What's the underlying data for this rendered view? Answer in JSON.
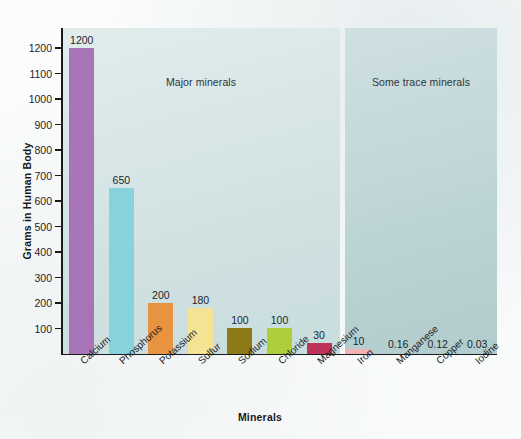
{
  "chart_data": {
    "type": "bar",
    "title": "",
    "xlabel": "Minerals",
    "ylabel": "Grams in Human Body",
    "ylim": [
      0,
      1260
    ],
    "grid": false,
    "legend": "none",
    "y_ticks": [
      100,
      200,
      300,
      400,
      500,
      600,
      700,
      800,
      900,
      1000,
      1100,
      1200
    ],
    "y_tick_labels": [
      "100",
      "200",
      "300",
      "400",
      "500",
      "600",
      "700",
      "800",
      "900",
      "1000",
      "1100",
      "1200"
    ],
    "categories": [
      "Calcium",
      "Phosphorus",
      "Potassium",
      "Sulfur",
      "Sodium",
      "Chloride",
      "Magnesium",
      "Iron",
      "Manganese",
      "Copper",
      "Iodine"
    ],
    "values": [
      1200,
      650,
      200,
      180,
      100,
      100,
      30,
      10,
      0.16,
      0.12,
      0.03
    ],
    "value_labels": [
      "1200",
      "650",
      "200",
      "180",
      "100",
      "100",
      "30",
      "10",
      "0.16",
      "0.12",
      "0.03"
    ],
    "bar_colors": [
      "#a874b8",
      "#86d2dd",
      "#e8933f",
      "#f5e394",
      "#8d7a16",
      "#aece3b",
      "#bf3259",
      "#f2b3b8",
      "#b2cdce",
      "#b2cdce",
      "#b2cdce"
    ],
    "drawn_heights_px": [
      306,
      166,
      51,
      46,
      26,
      26,
      11,
      5,
      0,
      0,
      0
    ],
    "annotations": [
      {
        "text": "Major minerals",
        "group": [
          "Calcium",
          "Phosphorus",
          "Potassium",
          "Sulfur",
          "Sodium",
          "Chloride",
          "Magnesium"
        ]
      },
      {
        "text": "Some trace minerals",
        "group": [
          "Iron",
          "Manganese",
          "Copper",
          "Iodine"
        ]
      }
    ]
  },
  "panels": {
    "major": {
      "label": "Major minerals",
      "color": "#d6e5e6"
    },
    "trace": {
      "label": "Some trace minerals",
      "color": "#bdd4d5"
    }
  },
  "axes": {
    "y_title": "Grams in Human Body",
    "x_title": "Minerals"
  }
}
